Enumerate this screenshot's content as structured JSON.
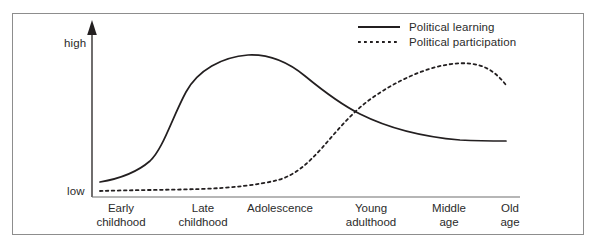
{
  "figure": {
    "frame_border_color": "#8d8d8d",
    "background": "#ffffff",
    "line_color": "#231f20"
  },
  "axes": {
    "y_top_label": "high",
    "y_bottom_label": "low",
    "y_axis_arrow": "arrow-up-icon",
    "x_axis_baseline": true
  },
  "legend": {
    "items": [
      {
        "label": "Political learning",
        "style": "solid",
        "swatch": "solid-line-icon"
      },
      {
        "label": "Political participation",
        "style": "dotted",
        "swatch": "dotted-line-icon"
      }
    ]
  },
  "chart_data": {
    "type": "line",
    "title": "",
    "subtitle": "",
    "xlabel": "",
    "ylabel": "",
    "grid": false,
    "legend_position": "top-right",
    "categories": [
      "Early childhood",
      "Late childhood",
      "Adolescence",
      "Young adulthood",
      "Middle age",
      "Old age"
    ],
    "ytick_labels": [
      "low",
      "high"
    ],
    "ylim": [
      0,
      100
    ],
    "annotations": [
      "Curves cross during young adulthood",
      "Political learning peaks at adolescence",
      "Political participation peaks at middle age"
    ],
    "series": [
      {
        "name": "Political learning",
        "style": "solid",
        "color": "#231f20",
        "x": [
          0.0,
          0.5,
          1.0,
          1.5,
          2.0,
          2.5,
          3.0,
          3.5,
          4.0,
          4.5,
          5.0,
          5.5
        ],
        "values": [
          8,
          12,
          22,
          58,
          86,
          92,
          84,
          70,
          58,
          48,
          42,
          40
        ]
      },
      {
        "name": "Political participation",
        "style": "dotted",
        "color": "#231f20",
        "x": [
          0.0,
          0.5,
          1.0,
          1.5,
          2.0,
          2.5,
          3.0,
          3.5,
          4.0,
          4.5,
          5.0,
          5.5
        ],
        "values": [
          4,
          4,
          5,
          7,
          13,
          26,
          50,
          72,
          84,
          87,
          84,
          76
        ]
      }
    ]
  }
}
